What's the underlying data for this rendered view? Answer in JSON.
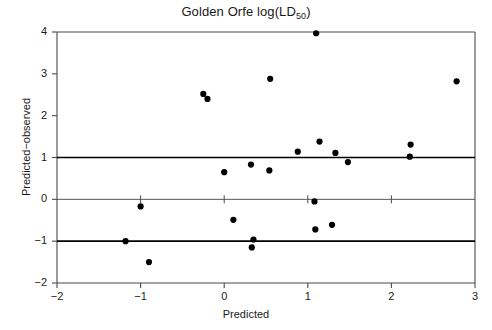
{
  "chart_data": {
    "type": "scatter",
    "title": "Golden Orfe log(LD50)",
    "title_main": "Golden Orfe log(LD",
    "title_sub": "50",
    "title_tail": ")",
    "xlabel": "Predicted",
    "ylabel": "Predicted−observed",
    "xlim": [
      -2,
      3
    ],
    "ylim": [
      -2,
      4
    ],
    "xticks": [
      -2,
      -1,
      0,
      1,
      2,
      3
    ],
    "xtick_labels": [
      "−2",
      "−1",
      "0",
      "1",
      "2",
      "3"
    ],
    "yticks": [
      -2,
      -1,
      0,
      1,
      2,
      3,
      4
    ],
    "ytick_labels": [
      "−2",
      "−1",
      "0",
      "1",
      "2",
      "3",
      "4"
    ],
    "grid": false,
    "legend": "none",
    "marker": "filled-circle",
    "marker_color": "#000000",
    "marker_size_px": 5.2,
    "reference_lines": [
      {
        "name": "upper-limit",
        "y": 1,
        "color": "#000000",
        "width": 1.6
      },
      {
        "name": "zero-line",
        "y": 0,
        "color": "#555555",
        "width": 1.0
      },
      {
        "name": "lower-limit",
        "y": -1,
        "color": "#000000",
        "width": 1.6
      }
    ],
    "inner_ticks_on_zero_line": [
      -1,
      0,
      1,
      2
    ],
    "x": [
      -0.25,
      -0.2,
      1.1,
      0.55,
      2.78,
      1.14,
      0.88,
      1.33,
      2.23,
      2.22,
      1.48,
      0.32,
      0.54,
      0.0,
      1.08,
      -1.0,
      0.11,
      1.09,
      1.29,
      -1.18,
      0.35,
      0.33,
      -0.9
    ],
    "y": [
      2.52,
      2.4,
      3.97,
      2.88,
      2.82,
      1.38,
      1.14,
      1.11,
      1.31,
      1.02,
      0.89,
      0.83,
      0.69,
      0.65,
      -0.05,
      -0.17,
      -0.49,
      -0.72,
      -0.61,
      -1.0,
      -0.96,
      -1.15,
      -1.5
    ],
    "points": [
      {
        "x": -0.25,
        "y": 2.52
      },
      {
        "x": -0.2,
        "y": 2.4
      },
      {
        "x": 1.1,
        "y": 3.97
      },
      {
        "x": 0.55,
        "y": 2.88
      },
      {
        "x": 2.78,
        "y": 2.82
      },
      {
        "x": 1.14,
        "y": 1.38
      },
      {
        "x": 0.88,
        "y": 1.14
      },
      {
        "x": 1.33,
        "y": 1.11
      },
      {
        "x": 2.23,
        "y": 1.31
      },
      {
        "x": 2.22,
        "y": 1.02
      },
      {
        "x": 1.48,
        "y": 0.89
      },
      {
        "x": 0.32,
        "y": 0.83
      },
      {
        "x": 0.54,
        "y": 0.69
      },
      {
        "x": 0.0,
        "y": 0.65
      },
      {
        "x": 1.08,
        "y": -0.05
      },
      {
        "x": -1.0,
        "y": -0.17
      },
      {
        "x": 0.11,
        "y": -0.49
      },
      {
        "x": 1.09,
        "y": -0.72
      },
      {
        "x": 1.29,
        "y": -0.61
      },
      {
        "x": -1.18,
        "y": -1.0
      },
      {
        "x": 0.35,
        "y": -0.96
      },
      {
        "x": 0.33,
        "y": -1.15
      },
      {
        "x": -0.9,
        "y": -1.5
      }
    ],
    "n_points": 23
  },
  "plot_geometry": {
    "left": 57,
    "right": 475,
    "top": 32,
    "bottom": 283
  }
}
